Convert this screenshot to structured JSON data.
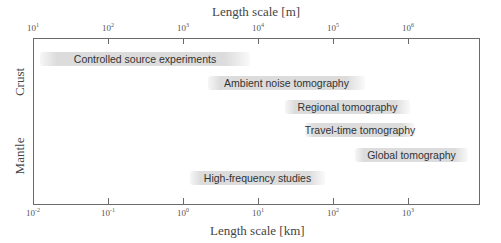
{
  "chart_data": {
    "type": "bar",
    "orientation": "horizontal-range",
    "title": "",
    "top_axis": {
      "label": "Length scale [m]",
      "scale": "log",
      "ticks": [
        {
          "base": "10",
          "exp": "1",
          "x": 33
        },
        {
          "base": "10",
          "exp": "2",
          "x": 108
        },
        {
          "base": "10",
          "exp": "3",
          "x": 183
        },
        {
          "base": "10",
          "exp": "4",
          "x": 258
        },
        {
          "base": "10",
          "exp": "5",
          "x": 333
        },
        {
          "base": "10",
          "exp": "6",
          "x": 408
        }
      ]
    },
    "bottom_axis": {
      "label": "Length scale [km]",
      "scale": "log",
      "xlim_km": [
        0.01,
        10000
      ],
      "ticks": [
        {
          "base": "10",
          "exp": "-2",
          "x": 33
        },
        {
          "base": "10",
          "exp": "-1",
          "x": 108
        },
        {
          "base": "10",
          "exp": "0",
          "x": 183
        },
        {
          "base": "10",
          "exp": "1",
          "x": 258
        },
        {
          "base": "10",
          "exp": "2",
          "x": 333
        },
        {
          "base": "10",
          "exp": "3",
          "x": 408
        }
      ]
    },
    "y_labels": [
      {
        "text": "Crust",
        "y": 82
      },
      {
        "text": "Mantle",
        "y": 156
      }
    ],
    "series": [
      {
        "name": "Controlled source experiments",
        "range_km": [
          0.012,
          7
        ],
        "left": 40,
        "width": 210,
        "top": 52
      },
      {
        "name": "Ambient noise tomography",
        "range_km": [
          2.5,
          300
        ],
        "left": 208,
        "width": 157,
        "top": 76
      },
      {
        "name": "Regional tomography",
        "range_km": [
          25,
          1000
        ],
        "left": 285,
        "width": 125,
        "top": 100
      },
      {
        "name": "Travel-time tomography",
        "range_km": [
          45,
          1200
        ],
        "left": 305,
        "width": 110,
        "top": 123
      },
      {
        "name": "Global tomography",
        "range_km": [
          200,
          6000
        ],
        "left": 355,
        "width": 113,
        "top": 148
      },
      {
        "name": "High-frequency studies",
        "range_km": [
          1.2,
          80
        ],
        "left": 190,
        "width": 135,
        "top": 171
      }
    ],
    "grid": false,
    "legend": "none"
  }
}
